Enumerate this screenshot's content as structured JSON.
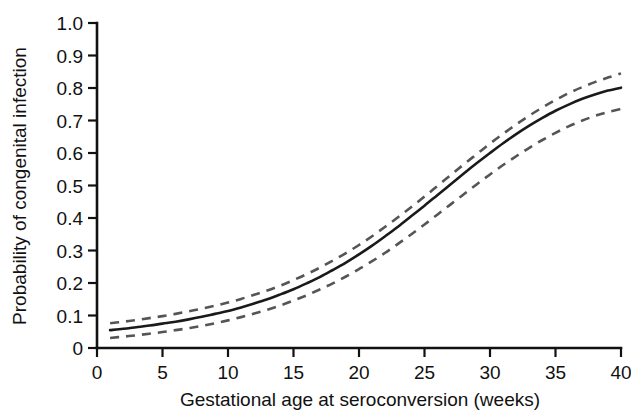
{
  "chart_data": {
    "type": "line",
    "title": "",
    "subtitle": "",
    "xlabel": "Gestational age at seroconversion (weeks)",
    "ylabel": "Probability of congenital infection",
    "xlim": [
      0,
      40
    ],
    "ylim": [
      0,
      1.0
    ],
    "grid": false,
    "legend_position": "none",
    "xticks": [
      0,
      5,
      10,
      15,
      20,
      25,
      30,
      35,
      40
    ],
    "xtick_labels": [
      "0",
      "5",
      "10",
      "15",
      "20",
      "25",
      "30",
      "35",
      "40"
    ],
    "yticks": [
      0,
      0.1,
      0.2,
      0.3,
      0.4,
      0.5,
      0.6,
      0.7,
      0.8,
      0.9,
      1.0
    ],
    "ytick_labels": [
      "0",
      "0.1",
      "0.2",
      "0.3",
      "0.4",
      "0.5",
      "0.6",
      "0.7",
      "0.8",
      "0.9",
      "1.0"
    ],
    "x": [
      1,
      2,
      3,
      4,
      5,
      6,
      7,
      8,
      9,
      10,
      11,
      12,
      13,
      14,
      15,
      16,
      17,
      18,
      19,
      20,
      21,
      22,
      23,
      24,
      25,
      26,
      27,
      28,
      29,
      30,
      31,
      32,
      33,
      34,
      35,
      36,
      37,
      38,
      39,
      40
    ],
    "series": [
      {
        "name": "Fitted probability",
        "style": "solid",
        "color": "#1a1a1a",
        "values": [
          0.055,
          0.059,
          0.064,
          0.069,
          0.075,
          0.081,
          0.088,
          0.096,
          0.105,
          0.114,
          0.125,
          0.137,
          0.15,
          0.165,
          0.181,
          0.199,
          0.218,
          0.24,
          0.263,
          0.288,
          0.315,
          0.344,
          0.374,
          0.406,
          0.438,
          0.471,
          0.504,
          0.537,
          0.569,
          0.6,
          0.63,
          0.658,
          0.684,
          0.708,
          0.73,
          0.749,
          0.766,
          0.78,
          0.792,
          0.801
        ]
      },
      {
        "name": "Upper 95% confidence limit",
        "style": "dashed",
        "color": "#555555",
        "values": [
          0.076,
          0.081,
          0.086,
          0.092,
          0.098,
          0.105,
          0.113,
          0.121,
          0.13,
          0.14,
          0.151,
          0.164,
          0.177,
          0.192,
          0.209,
          0.227,
          0.247,
          0.269,
          0.292,
          0.317,
          0.344,
          0.373,
          0.403,
          0.434,
          0.466,
          0.499,
          0.532,
          0.565,
          0.597,
          0.629,
          0.659,
          0.688,
          0.715,
          0.74,
          0.763,
          0.784,
          0.802,
          0.818,
          0.832,
          0.845
        ]
      },
      {
        "name": "Lower 95% confidence limit",
        "style": "dashed",
        "color": "#555555",
        "values": [
          0.031,
          0.035,
          0.039,
          0.044,
          0.049,
          0.055,
          0.061,
          0.068,
          0.076,
          0.085,
          0.095,
          0.106,
          0.118,
          0.131,
          0.146,
          0.162,
          0.18,
          0.199,
          0.22,
          0.243,
          0.267,
          0.293,
          0.321,
          0.35,
          0.38,
          0.411,
          0.442,
          0.473,
          0.504,
          0.534,
          0.563,
          0.59,
          0.616,
          0.64,
          0.662,
          0.682,
          0.699,
          0.714,
          0.726,
          0.736
        ]
      }
    ],
    "annotations": []
  },
  "colors": {
    "background": "#ffffff",
    "axis": "#111111",
    "fit_line": "#1a1a1a",
    "ci_line": "#555555",
    "text": "#111111"
  }
}
